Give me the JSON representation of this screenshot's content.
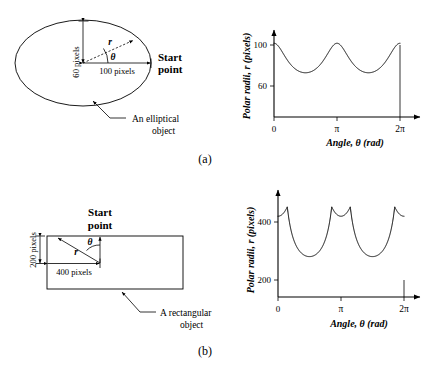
{
  "figure": {
    "panels": [
      {
        "id": "a",
        "panel_label": "(a)",
        "diagram": {
          "name": "ellipse-diagram",
          "object_caption_line1": "An elliptical",
          "object_caption_line2": "object",
          "start_point_line1": "Start",
          "start_point_line2": "point",
          "semi_minor_label": "60 pixels",
          "semi_major_label": "100 pixels",
          "radius_symbol": "r",
          "angle_symbol": "θ"
        }
      },
      {
        "id": "b",
        "panel_label": "(b)",
        "diagram": {
          "name": "rectangle-diagram",
          "object_caption_line1": "A rectangular",
          "object_caption_line2": "object",
          "start_point_line1": "Start",
          "start_point_line2": "point",
          "half_height_label": "200 pixels",
          "half_width_label": "400 pixels",
          "radius_symbol": "r",
          "angle_symbol": "θ"
        }
      }
    ]
  },
  "chart_data": [
    {
      "type": "line",
      "name": "ellipse-signature",
      "title": "",
      "xlabel": "Angle, θ (rad)",
      "ylabel": "Polar radii, r (pixels)",
      "xlim": [
        0,
        6.283185307179586
      ],
      "ylim": [
        0,
        118
      ],
      "xticks": [
        0,
        3.141592653589793,
        6.283185307179586
      ],
      "xticklabels": [
        "0",
        "π",
        "2π"
      ],
      "yticks": [
        60,
        100
      ],
      "yticklabels": [
        "60",
        "100"
      ],
      "grid": false,
      "legend": null,
      "shape": {
        "kind": "ellipse",
        "semi_major_a": 100,
        "semi_minor_b": 60
      },
      "x": [
        0,
        0.19634954,
        0.39269908,
        0.58904862,
        0.78539816,
        0.9817477,
        1.17809725,
        1.37444679,
        1.57079633,
        1.76714587,
        1.96349541,
        2.15984495,
        2.35619449,
        2.55254403,
        2.74889357,
        2.94524311,
        3.14159265,
        3.33794219,
        3.53429174,
        3.73064128,
        3.92699082,
        4.12334036,
        4.3196899,
        4.51603944,
        4.71238898,
        4.90873852,
        5.10508806,
        5.3005776,
        5.49778714,
        5.69413668,
        5.89048623,
        6.08683577,
        6.28318531
      ],
      "y": [
        100.0,
        97.8,
        92.2,
        84.6,
        77.1,
        70.7,
        65.7,
        62.1,
        60.0,
        62.1,
        65.7,
        70.7,
        77.1,
        84.6,
        92.2,
        97.8,
        100.0,
        97.8,
        92.2,
        84.6,
        77.1,
        70.7,
        65.7,
        62.1,
        60.0,
        62.1,
        65.7,
        70.7,
        77.1,
        84.6,
        92.2,
        97.8,
        100.0
      ],
      "annotations": [
        {
          "text": "minimum radius 60 at θ = π/2 and 3π/2"
        },
        {
          "text": "maximum radius 100 at θ = 0, π, 2π"
        }
      ]
    },
    {
      "type": "line",
      "name": "rectangle-signature",
      "title": "",
      "xlabel": "Angle, θ (rad)",
      "ylabel": "Polar radii, r (pixels)",
      "xlim": [
        0,
        6.283185307179586
      ],
      "ylim": [
        0,
        530
      ],
      "xticks": [
        0,
        3.141592653589793,
        6.283185307179586
      ],
      "xticklabels": [
        "0",
        "π",
        "2π"
      ],
      "yticks": [
        200,
        400
      ],
      "yticklabels": [
        "200",
        "400"
      ],
      "grid": false,
      "legend": null,
      "shape": {
        "kind": "rectangle",
        "half_width": 400,
        "half_height": 200
      },
      "x": [
        0,
        0.19634954,
        0.39269908,
        0.58904862,
        0.78539816,
        0.9817477,
        1.17809725,
        1.37444679,
        1.57079633,
        1.76714587,
        1.96349541,
        2.15984495,
        2.35619449,
        2.55254403,
        2.74889357,
        2.94524311,
        3.14159265,
        3.33794219,
        3.53429174,
        3.73064128,
        3.92699082,
        4.12334036,
        4.3196899,
        4.51603944,
        4.71238898,
        4.90873852,
        5.10508806,
        5.3005776,
        5.49778714,
        5.69413668,
        5.89048623,
        6.08683577,
        6.28318531
      ],
      "y": [
        200.0,
        203.9,
        216.5,
        240.3,
        282.8,
        355.9,
        441.6,
        409.3,
        400.0,
        409.3,
        441.6,
        355.9,
        282.8,
        240.3,
        216.5,
        203.9,
        200.0,
        203.9,
        216.5,
        240.3,
        282.8,
        355.9,
        441.6,
        409.3,
        400.0,
        409.3,
        441.6,
        355.9,
        282.8,
        240.3,
        216.5,
        203.9,
        200.0
      ],
      "annotations": [
        {
          "text": "minimum radius 200 at θ = 0, π, 2π"
        },
        {
          "text": "twin peaks near 450 at the rectangle corners"
        },
        {
          "text": "local dip to 400 midway between corner peaks"
        }
      ]
    }
  ]
}
